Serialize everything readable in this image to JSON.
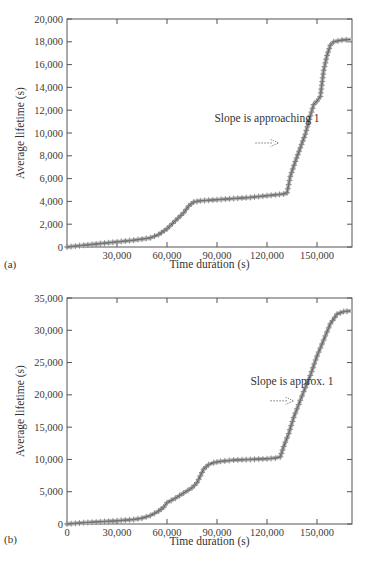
{
  "chart_data": [
    {
      "id": "a",
      "panel_label": "(a)",
      "type": "line",
      "marker": "+",
      "xlabel": "Time duration (s)",
      "ylabel": "Average lifetime (s)",
      "xlim": [
        0,
        171000
      ],
      "ylim": [
        0,
        20000
      ],
      "xticks": [
        30000,
        60000,
        90000,
        120000,
        150000
      ],
      "xtick_labels": [
        "30,000",
        "60,000",
        "90,000",
        "120,000",
        "150,000"
      ],
      "yticks": [
        0,
        2000,
        4000,
        6000,
        8000,
        10000,
        12000,
        14000,
        16000,
        18000,
        20000
      ],
      "ytick_labels": [
        "0",
        "2,000",
        "4,000",
        "6,000",
        "8,000",
        "10,000",
        "12,000",
        "14,000",
        "16,000",
        "18,000",
        "20,000"
      ],
      "grid": false,
      "annotation": {
        "text": "Slope is approaching 1",
        "x": 120000,
        "y": 11000,
        "arrow_from": [
          113000,
          10000
        ],
        "arrow_to": [
          127000,
          10000
        ]
      },
      "x": [
        0,
        10000,
        20000,
        30000,
        40000,
        50000,
        55000,
        60000,
        65000,
        70000,
        73000,
        76000,
        80000,
        90000,
        100000,
        110000,
        120000,
        130000,
        132000,
        134000,
        137000,
        140000,
        143000,
        146000,
        148000,
        150000,
        152000,
        154000,
        156000,
        158000,
        160000,
        165000,
        170000
      ],
      "values": [
        0,
        150,
        300,
        450,
        600,
        800,
        1100,
        1600,
        2300,
        3000,
        3600,
        3950,
        4050,
        4150,
        4250,
        4350,
        4500,
        4650,
        4750,
        6200,
        7500,
        8700,
        9900,
        11500,
        12500,
        12800,
        13200,
        15500,
        16800,
        17700,
        18000,
        18150,
        18200
      ]
    },
    {
      "id": "b",
      "panel_label": "(b)",
      "type": "line",
      "marker": "+",
      "xlabel": "Time duration (s)",
      "ylabel": "Average lifetime (s)",
      "xlim": [
        0,
        171000
      ],
      "ylim": [
        0,
        35000
      ],
      "xticks": [
        0,
        30000,
        60000,
        90000,
        120000,
        150000
      ],
      "xtick_labels": [
        "0",
        "30,000",
        "60,000",
        "90,000",
        "120,000",
        "150,000"
      ],
      "yticks": [
        0,
        5000,
        10000,
        15000,
        20000,
        25000,
        30000,
        35000
      ],
      "ytick_labels": [
        "0",
        "5,000",
        "10,000",
        "15,000",
        "20,000",
        "25,000",
        "30,000",
        "35,000"
      ],
      "grid": false,
      "annotation": {
        "text": "Slope is approx. 1",
        "x": 135000,
        "y": 21500,
        "arrow_from": [
          122000,
          20000
        ],
        "arrow_to": [
          136000,
          20000
        ]
      },
      "x": [
        0,
        10000,
        20000,
        30000,
        40000,
        45000,
        50000,
        55000,
        58000,
        60000,
        65000,
        70000,
        75000,
        78000,
        82000,
        85000,
        88000,
        92000,
        100000,
        110000,
        120000,
        125000,
        128000,
        130000,
        133000,
        136000,
        139000,
        142000,
        146000,
        150000,
        154000,
        158000,
        162000,
        166000,
        170000
      ],
      "values": [
        0,
        200,
        350,
        500,
        700,
        900,
        1300,
        2000,
        2600,
        3300,
        4000,
        4800,
        5600,
        6400,
        8500,
        9200,
        9500,
        9700,
        9900,
        10000,
        10100,
        10200,
        10400,
        12000,
        14000,
        16500,
        18500,
        20500,
        23000,
        26000,
        28500,
        31000,
        32500,
        32900,
        33000
      ]
    }
  ]
}
